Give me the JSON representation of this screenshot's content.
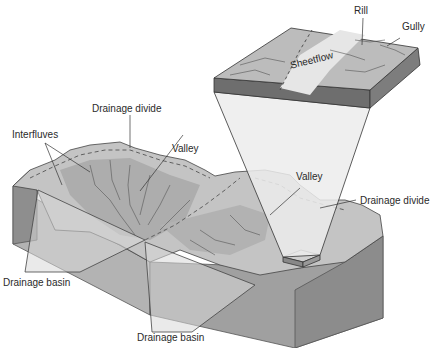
{
  "diagram": {
    "type": "block diagram of drainage basins",
    "labels": {
      "rill": "Rill",
      "gully": "Gully",
      "sheetflow": "Sheetflow",
      "drainage_divide_top": "Drainage divide",
      "interfluves": "Interfluves",
      "valley_left": "Valley",
      "valley_right": "Valley",
      "drainage_divide_right": "Drainage divide",
      "drainage_basin_left": "Drainage basin",
      "drainage_basin_bottom": "Drainage basin"
    },
    "colors": {
      "surface_light": "#c9c9c9",
      "surface_mid": "#a9a9a9",
      "block_side": "#8f8f8f",
      "block_front": "#b4b4b4",
      "line": "#333333",
      "inset_top": "#bdbdbd"
    }
  }
}
